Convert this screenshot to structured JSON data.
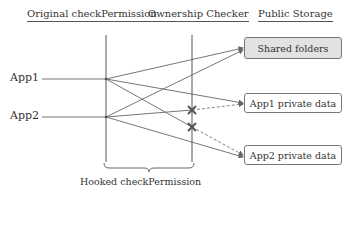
{
  "headers": {
    "original": "Original checkPermission",
    "checker": "Ownership Checker",
    "storage": "Public Storage"
  },
  "apps": [
    {
      "label": "App1"
    },
    {
      "label": "App2"
    }
  ],
  "storage_boxes": [
    {
      "label": "Shared folders",
      "fill": "#e2e2e2"
    },
    {
      "label": "App1 private data",
      "fill": "#ffffff"
    },
    {
      "label": "App2 private data",
      "fill": "#ffffff"
    }
  ],
  "brace_label": "Hooked checkPermission",
  "connections": [
    {
      "from": "App1",
      "to": "Shared folders",
      "style": "solid",
      "blocked": false
    },
    {
      "from": "App1",
      "to": "App1 private data",
      "style": "solid",
      "blocked": false
    },
    {
      "from": "App1",
      "to": "App2 private data",
      "style": "dashed",
      "blocked": true
    },
    {
      "from": "App2",
      "to": "Shared folders",
      "style": "solid",
      "blocked": false
    },
    {
      "from": "App2",
      "to": "App1 private data",
      "style": "dashed",
      "blocked": true
    },
    {
      "from": "App2",
      "to": "App2 private data",
      "style": "solid",
      "blocked": false
    }
  ],
  "colors": {
    "line": "#666666",
    "blocked_mark": "#555555"
  }
}
